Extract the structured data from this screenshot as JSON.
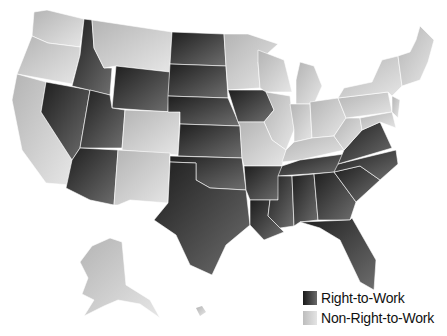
{
  "map": {
    "title": "",
    "type": "US states right-to-work status",
    "states": {
      "right_to_work": [
        "ID",
        "WY",
        "UT",
        "AZ",
        "NV",
        "ND",
        "SD",
        "NE",
        "KS",
        "OK",
        "TX",
        "IA",
        "AR",
        "LA",
        "MS",
        "AL",
        "TN",
        "GA",
        "FL",
        "SC",
        "NC",
        "VA"
      ],
      "non_right_to_work": [
        "WA",
        "OR",
        "CA",
        "MT",
        "CO",
        "NM",
        "MN",
        "WI",
        "MO",
        "IL",
        "MI",
        "IN",
        "OH",
        "KY",
        "WV",
        "PA",
        "NY",
        "VT",
        "NH",
        "ME",
        "MA",
        "CT",
        "RI",
        "NJ",
        "DE",
        "MD",
        "AK",
        "HI"
      ]
    }
  },
  "legend": {
    "items": [
      {
        "label": "Right-to-Work",
        "color": "#3a3a3a"
      },
      {
        "label": "Non-Right-to-Work",
        "color": "#d0d0d0"
      }
    ]
  },
  "colors": {
    "rtw_dark": "#222222",
    "rtw_light": "#777777",
    "non_dark": "#bbbbbb",
    "non_light": "#e8e8e8"
  }
}
